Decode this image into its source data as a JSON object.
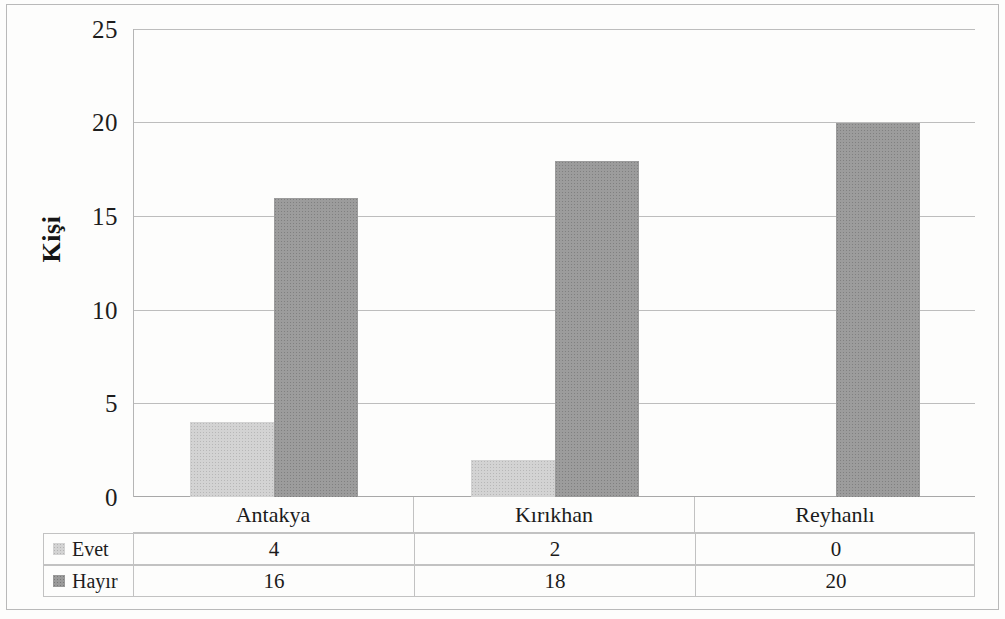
{
  "chart_data": {
    "type": "bar",
    "title": "",
    "xlabel": "",
    "ylabel": "Kişi",
    "categories": [
      "Antakya",
      "Kırıkhan",
      "Reyhanlı"
    ],
    "series": [
      {
        "name": "Evet",
        "values": [
          4,
          2,
          0
        ],
        "color": "#d3d3d3"
      },
      {
        "name": "Hayır",
        "values": [
          16,
          18,
          20
        ],
        "color": "#9c9c9c"
      }
    ],
    "ylim": [
      0,
      25
    ],
    "yticks": [
      0,
      5,
      10,
      15,
      20,
      25
    ],
    "ytick_labels": [
      "0",
      "5",
      "10",
      "15",
      "20",
      "25"
    ],
    "grid": true,
    "legend_position": "bottom-table",
    "data_table_visible": true
  },
  "axis": {
    "y_title": "Kişi",
    "ticks": [
      "25",
      "20",
      "15",
      "10",
      "5",
      "0"
    ]
  },
  "table": {
    "categories": [
      "Antakya",
      "Kırıkhan",
      "Reyhanlı"
    ],
    "rows": [
      {
        "label": "Evet",
        "values": [
          "4",
          "2",
          "0"
        ]
      },
      {
        "label": "Hayır",
        "values": [
          "16",
          "18",
          "20"
        ]
      }
    ]
  }
}
